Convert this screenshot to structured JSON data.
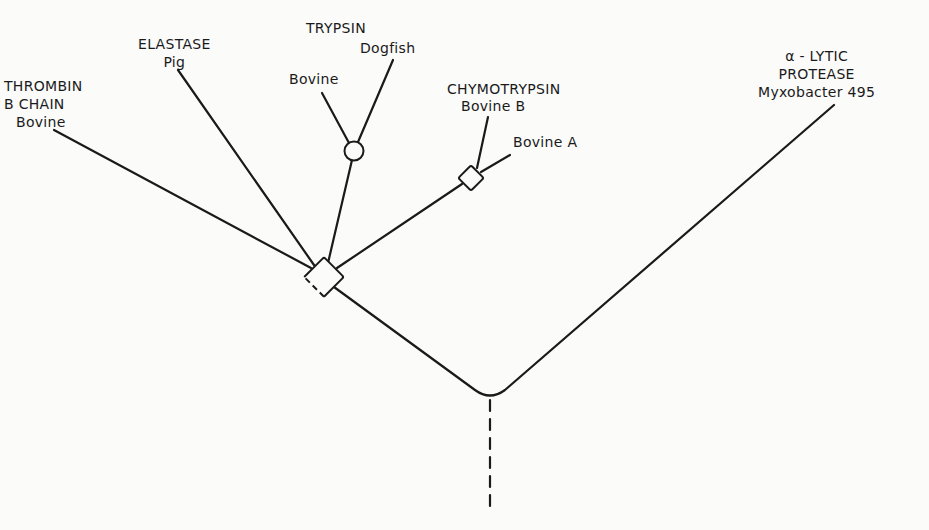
{
  "figure": {
    "type": "phylogenetic-tree"
  },
  "labels": {
    "thrombin": {
      "line1": "THROMBIN",
      "line2": "B CHAIN",
      "line3": "Bovine"
    },
    "elastase": {
      "line1": "ELASTASE",
      "line2": "Pig"
    },
    "trypsin": {
      "group": "TRYPSIN",
      "bovine": "Bovine",
      "dogfish": "Dogfish"
    },
    "chymotrypsin": {
      "group": "CHYMOTRYPSIN",
      "bovine_b": "Bovine B",
      "bovine_a": "Bovine A"
    },
    "alpha_lytic": {
      "line1": "α - LYTIC",
      "line2": "PROTEASE",
      "line3": "Myxobacter 495"
    }
  },
  "nodes": {
    "main_diamond": {
      "shape": "diamond",
      "style": "partially-dashed",
      "x": 324,
      "y": 277
    },
    "trypsin_circle": {
      "shape": "circle",
      "x": 354,
      "y": 151
    },
    "chymotrypsin_diamond": {
      "shape": "diamond",
      "x": 471,
      "y": 178
    },
    "root": {
      "shape": "curve",
      "x": 490,
      "y": 398
    }
  },
  "colors": {
    "background": "#fbfbfa",
    "line": "#1a1a1a"
  }
}
